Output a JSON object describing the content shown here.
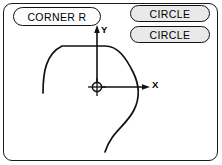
{
  "panel": {
    "name": "corner-radius-geometry-panel",
    "background_color": "#ffffff",
    "border_color": "#1a1a1a"
  },
  "softkeys": [
    {
      "id": "corner-r",
      "label": "CORNER R",
      "fill_color": "#fdfdfd",
      "text_color": "#000000",
      "state": "selected"
    },
    {
      "id": "circle-1",
      "label": "CIRCLE",
      "fill_color": "#e9e9e9",
      "text_color": "#000000",
      "state": "normal"
    },
    {
      "id": "circle-2",
      "label": "CIRCLE",
      "fill_color": "#e9e9e9",
      "text_color": "#000000",
      "state": "normal"
    }
  ],
  "diagram": {
    "name": "contour-corner-radius-diagram",
    "line_color": "#111111",
    "axes": {
      "x_label": "X",
      "y_label": "Y",
      "origin_marker": "crosshair-circle",
      "origin": {
        "x": 97,
        "y": 87
      }
    },
    "contour_description": "Profile curve with rounded top-left corner, flat top segment, descending right flank crossing the X axis, and an S-shaped tail exiting the bottom of the frame"
  }
}
